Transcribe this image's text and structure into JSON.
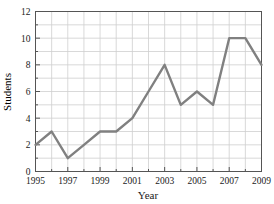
{
  "chart_data": {
    "type": "line",
    "title": "",
    "xlabel": "Year",
    "ylabel": "Students",
    "x": [
      1995,
      1996,
      1997,
      1998,
      1999,
      2000,
      2001,
      2002,
      2003,
      2004,
      2005,
      2006,
      2007,
      2008,
      2009
    ],
    "values": [
      2,
      3,
      1,
      2,
      3,
      3,
      4,
      6,
      8,
      5,
      6,
      5,
      10,
      10,
      8
    ],
    "series": [
      {
        "name": "Students",
        "values": [
          2,
          3,
          1,
          2,
          3,
          3,
          4,
          6,
          8,
          5,
          6,
          5,
          10,
          10,
          8
        ]
      }
    ],
    "xlim": [
      1995,
      2009
    ],
    "ylim": [
      0,
      12
    ],
    "xticks": [
      1995,
      1996,
      1997,
      1998,
      1999,
      2000,
      2001,
      2002,
      2003,
      2004,
      2005,
      2006,
      2007,
      2008,
      2009
    ],
    "xtick_labels": [
      "1995",
      "",
      "1997",
      "",
      "1999",
      "",
      "2001",
      "",
      "2003",
      "",
      "2005",
      "",
      "2007",
      "",
      "2009"
    ],
    "yticks": [
      0,
      1,
      2,
      3,
      4,
      5,
      6,
      7,
      8,
      9,
      10,
      11,
      12
    ],
    "ytick_labels": [
      "0",
      "",
      "2",
      "",
      "4",
      "",
      "6",
      "",
      "8",
      "",
      "10",
      "",
      "12"
    ],
    "grid": true,
    "legend": false,
    "legend_position": "none",
    "line_color": "#808080",
    "grid_color": "#cfcfcf",
    "frame_color": "#555555",
    "background_color": "#ffffff"
  }
}
